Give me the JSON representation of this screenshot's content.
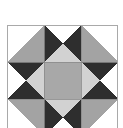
{
  "diagram": {
    "type": "quilt-block",
    "grid": {
      "rows": 3,
      "cols": 3,
      "cell_px": 37
    },
    "colors": {
      "background": "#ffffff",
      "dark": "#2e2e2e",
      "medium": "#a3a3a3",
      "light": "#d2d2d2",
      "center": "#a8a8a8",
      "border": "#a9a9a9",
      "seam": "#888888"
    }
  }
}
